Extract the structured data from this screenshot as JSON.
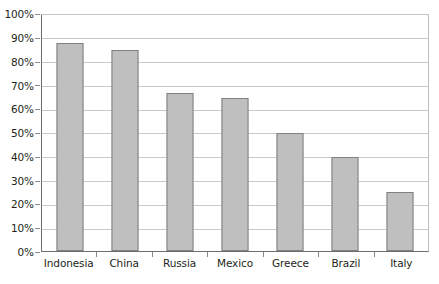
{
  "chart_data": {
    "type": "bar",
    "title": "",
    "xlabel": "",
    "ylabel": "",
    "categories": [
      "Indonesia",
      "China",
      "Russia",
      "Mexico",
      "Greece",
      "Brazil",
      "Italy"
    ],
    "values": [
      88,
      85,
      67,
      65,
      50,
      40,
      25
    ],
    "ylim": [
      0,
      100
    ],
    "ytick_labels": [
      "100%",
      "90%",
      "80%",
      "70%",
      "60%",
      "50%",
      "40%",
      "30%",
      "20%",
      "10%",
      "0%"
    ],
    "ytick_values": [
      100,
      90,
      80,
      70,
      60,
      50,
      40,
      30,
      20,
      10,
      0
    ],
    "grid": true,
    "legend": "none",
    "bar_fill_color": "#BFBFBF",
    "bar_border_color": "#808080",
    "gridline_color": "#C9C9C9",
    "axis_color": "#6D6D6D",
    "background_color": "#FFFFFF"
  }
}
